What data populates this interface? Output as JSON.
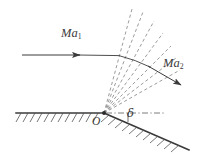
{
  "figure": {
    "background_color": "#ffffff",
    "line_color": "#3a3a3a",
    "dashed_color": "#7a7a7a",
    "width": 197,
    "height": 163
  },
  "labels": {
    "upstream_mach": {
      "base": "Ma",
      "sub": "1"
    },
    "downstream_mach": {
      "base": "Ma",
      "sub": "2"
    },
    "origin": "O",
    "deflection_angle": "δ"
  },
  "geometry": {
    "corner_point": {
      "x": 104,
      "y": 113
    },
    "upstream_arrow": {
      "x1": 22,
      "y1": 55,
      "x2": 116,
      "y2": 55
    },
    "upstream_arrowhead_at": {
      "x": 80,
      "y": 55
    },
    "downstream_arrow": {
      "x1": 120,
      "y1": 56,
      "x2": 182,
      "y2": 86
    },
    "horizontal_wall": {
      "x1": 16,
      "y1": 113,
      "x2": 104,
      "y2": 113
    },
    "inclined_wall": {
      "x1": 104,
      "y1": 113,
      "x2": 189,
      "y2": 150
    },
    "reference_line": {
      "x1": 104,
      "y1": 113,
      "x2": 166,
      "y2": 113
    },
    "mach_line_count": 7,
    "wall_deflection_degrees": 23
  }
}
